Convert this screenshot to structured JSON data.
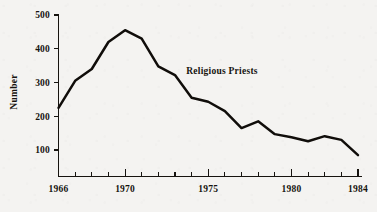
{
  "chart_data": {
    "type": "line",
    "title": "",
    "subtitle": "",
    "annotation": "Religious Priests",
    "xlabel": "",
    "ylabel": "Number",
    "xlim": [
      1966,
      1984
    ],
    "ylim": [
      0,
      500
    ],
    "grid": false,
    "legend_position": "none",
    "x_tick_labels": [
      "1966",
      "1970",
      "1975",
      "1980",
      "1984"
    ],
    "x_tick_values": [
      1966,
      1970,
      1975,
      1980,
      1984
    ],
    "x_minor_ticks": [
      1966,
      1967,
      1968,
      1969,
      1970,
      1971,
      1972,
      1973,
      1974,
      1975,
      1976,
      1977,
      1978,
      1979,
      1980,
      1981,
      1982,
      1983,
      1984
    ],
    "y_tick_labels": [
      "100",
      "200",
      "300",
      "400",
      "500"
    ],
    "y_tick_values": [
      100,
      200,
      300,
      400,
      500
    ],
    "series": [
      {
        "name": "Religious Priests",
        "color": "#100d0a",
        "x": [
          1966,
          1967,
          1968,
          1969,
          1970,
          1971,
          1972,
          1973,
          1974,
          1975,
          1976,
          1977,
          1978,
          1979,
          1980,
          1981,
          1982,
          1983,
          1984
        ],
        "values": [
          225,
          305,
          340,
          420,
          455,
          430,
          348,
          322,
          255,
          243,
          215,
          165,
          185,
          147,
          138,
          126,
          141,
          130,
          85
        ]
      }
    ]
  },
  "axes": {
    "y_axis_title": "Number"
  },
  "colors": {
    "background": "#f4f3f1",
    "ink": "#16130f",
    "line": "#100d0a"
  }
}
